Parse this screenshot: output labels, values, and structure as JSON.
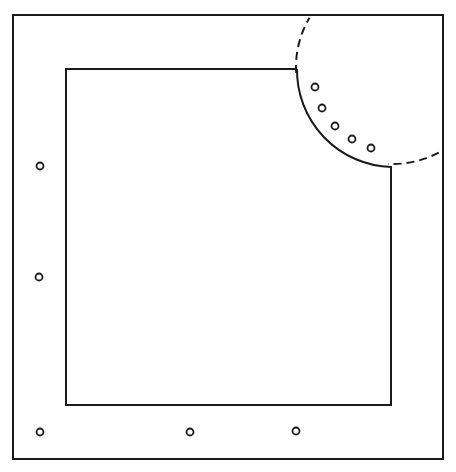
{
  "diagram": {
    "stroke_color": "#1a1a1a",
    "background": "#ffffff",
    "outer_square": {
      "x": 13,
      "y": 15,
      "w": 430,
      "h": 444
    },
    "inner_shape": {
      "left": 66,
      "top": 69,
      "right": 391,
      "bottom": 405,
      "notch_start_x": 297,
      "notch_end_y": 167
    },
    "arc_circle": {
      "cx": 393,
      "cy": 67,
      "r": 97
    },
    "markers_border": [
      {
        "x": 40,
        "y": 166
      },
      {
        "x": 39,
        "y": 277
      },
      {
        "x": 40,
        "y": 432
      },
      {
        "x": 190,
        "y": 432
      },
      {
        "x": 296,
        "y": 431
      }
    ],
    "markers_arc": [
      {
        "x": 315,
        "y": 87
      },
      {
        "x": 322,
        "y": 108
      },
      {
        "x": 335,
        "y": 126
      },
      {
        "x": 352,
        "y": 139
      },
      {
        "x": 371,
        "y": 148
      }
    ],
    "marker_radius": 3.5
  }
}
